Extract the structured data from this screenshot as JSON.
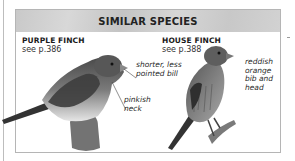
{
  "panel": {
    "title": "SIMILAR SPECIES",
    "species": [
      {
        "name": "PURPLE FINCH",
        "reference": "see p.386",
        "annotations": [
          "shorter, less pointed bill",
          "pinkish neck"
        ]
      },
      {
        "name": "HOUSE FINCH",
        "reference": "see p.388",
        "annotations": [
          "reddish orange bib and head"
        ]
      }
    ],
    "annotation_lines": {
      "shorter_1": "shorter, less",
      "shorter_2": "pointed bill",
      "pinkish_1": "pinkish",
      "pinkish_2": "neck",
      "reddish_1": "reddish",
      "reddish_2": "orange",
      "reddish_3": "bib and",
      "reddish_4": "head"
    }
  }
}
